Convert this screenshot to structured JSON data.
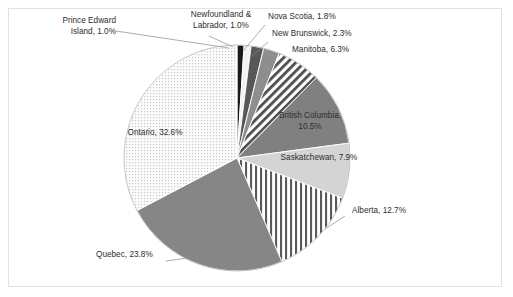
{
  "chart_data": {
    "type": "pie",
    "title": "",
    "subtitle": "",
    "xlabel": "",
    "ylabel": "",
    "legend_position": "none",
    "grid": false,
    "labels_inside_and_outside": true,
    "categories": [
      "Prince Edward Island",
      "Newfoundland & Labrador",
      "Nova Scotia",
      "New Brunswick",
      "Manitoba",
      "British Columbia",
      "Saskatchewan",
      "Alberta",
      "Quebec",
      "Ontario"
    ],
    "values": [
      1.0,
      1.0,
      1.8,
      2.3,
      6.3,
      10.5,
      7.9,
      12.7,
      23.8,
      32.6
    ],
    "unit": "%",
    "start_angle_deg": 0,
    "direction": "clockwise",
    "slices": [
      {
        "name": "Prince Edward Island",
        "value": 1.0,
        "label": "Prince Edward\nIsland, 1.0%",
        "fill": "#1a1a1a",
        "pattern": "solid",
        "start_deg": 0.0,
        "end_deg": 3.6,
        "label_placement": "outside-left",
        "leader": true
      },
      {
        "name": "Newfoundland & Labrador",
        "value": 1.0,
        "label": "Newfoundland &\nLabrador, 1.0%",
        "fill": "#f2f2f2",
        "pattern": "solid",
        "start_deg": 3.6,
        "end_deg": 7.2,
        "label_placement": "outside-top",
        "leader": true
      },
      {
        "name": "Nova Scotia",
        "value": 1.8,
        "label": "Nova Scotia, 1.8%",
        "fill": "#585858",
        "pattern": "solid",
        "start_deg": 7.2,
        "end_deg": 13.68,
        "label_placement": "outside-top-right",
        "leader": true
      },
      {
        "name": "New Brunswick",
        "value": 2.3,
        "label": "New Brunswick, 2.3%",
        "fill": "#8e8e8e",
        "pattern": "solid",
        "start_deg": 13.68,
        "end_deg": 21.96,
        "label_placement": "outside-top-right",
        "leader": true
      },
      {
        "name": "Manitoba",
        "value": 6.3,
        "label": "Manitoba, 6.3%",
        "fill": "#ffffff",
        "pattern": "diagonal-stripes",
        "start_deg": 21.96,
        "end_deg": 44.64,
        "label_placement": "outside-right",
        "leader": false
      },
      {
        "name": "British Columbia",
        "value": 10.5,
        "label": "British Columbia,\n10.5%",
        "fill": "#808080",
        "pattern": "solid",
        "start_deg": 44.64,
        "end_deg": 82.44,
        "label_placement": "inside",
        "leader": false
      },
      {
        "name": "Saskatchewan",
        "value": 7.9,
        "label": "Saskatchewan, 7.9%",
        "fill": "#d4d4d4",
        "pattern": "solid",
        "start_deg": 82.44,
        "end_deg": 110.88,
        "label_placement": "inside",
        "leader": false
      },
      {
        "name": "Alberta",
        "value": 12.7,
        "label": "Alberta, 12.7%",
        "fill": "#ffffff",
        "pattern": "vertical-stripes",
        "start_deg": 110.88,
        "end_deg": 156.6,
        "label_placement": "outside-right",
        "leader": true
      },
      {
        "name": "Quebec",
        "value": 23.8,
        "label": "Quebec, 23.8%",
        "fill": "#868686",
        "pattern": "solid",
        "start_deg": 156.6,
        "end_deg": 242.28,
        "label_placement": "outside-bottom-left",
        "leader": true
      },
      {
        "name": "Ontario",
        "value": 32.6,
        "label": "Ontario, 32.6%",
        "fill": "#fafafa",
        "pattern": "dots",
        "start_deg": 242.28,
        "end_deg": 360.0,
        "label_placement": "inside",
        "leader": false
      }
    ],
    "geometry": {
      "center_x": 237,
      "center_y": 158,
      "radius": 113
    },
    "colors": {
      "frame_border": "#e2e2e2",
      "background": "#ffffff",
      "text": "#2d2d2d",
      "slice_outline": "#ffffff"
    }
  }
}
